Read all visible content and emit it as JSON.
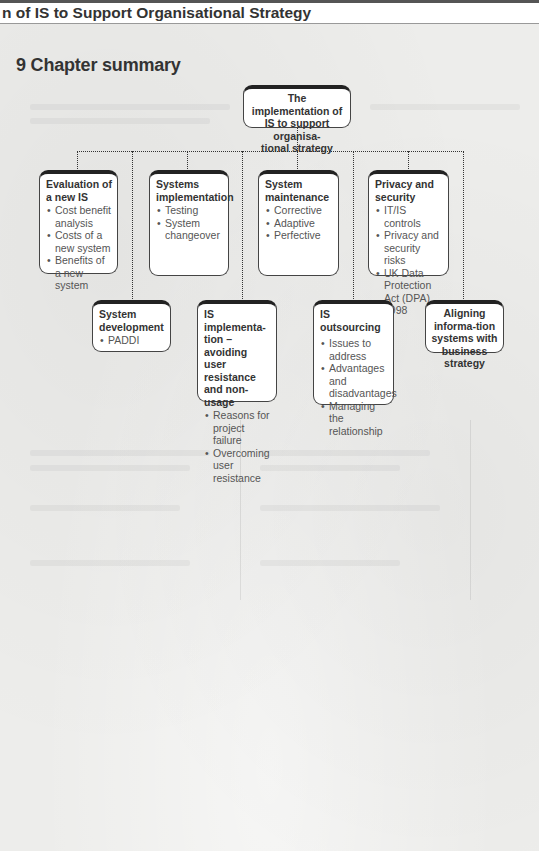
{
  "header": {
    "running_head": "n of IS to Support Organisational Strategy"
  },
  "chapter": {
    "title": "9 Chapter summary"
  },
  "diagram": {
    "root": {
      "title": "The implementation of IS to support organisa-tional strategy",
      "lines": [
        "The implementation of",
        "IS to support organisa-",
        "tional strategy"
      ]
    },
    "row1": [
      {
        "title": "Evaluation of a new IS",
        "items": [
          "Cost benefit analysis",
          "Costs of a new system",
          "Benefits of a new system"
        ]
      },
      {
        "title": "Systems implementation",
        "items": [
          "Testing",
          "System changeover"
        ]
      },
      {
        "title": "System maintenance",
        "items": [
          "Corrective",
          "Adaptive",
          "Perfective"
        ]
      },
      {
        "title": "Privacy and security",
        "items": [
          "IT/IS controls",
          "Privacy and security risks",
          "UK Data Protection Act (DPA) 1998"
        ]
      }
    ],
    "row2": [
      {
        "title": "System development",
        "items": [
          "PADDI"
        ]
      },
      {
        "title": "IS implementa-tion – avoiding user resistance and non-usage",
        "items": [
          "Reasons for project failure",
          "Overcoming user resistance"
        ]
      },
      {
        "title": "IS outsourcing",
        "items": [
          "Issues to address",
          "Advantages and disadvantages",
          "Managing the relationship"
        ]
      },
      {
        "title": "Aligning informa-tion systems with business strategy",
        "items": []
      }
    ]
  },
  "colors": {
    "box_border": "#222222",
    "box_fill": "#ffffff",
    "title_text": "#333333",
    "bullet_text": "#555555",
    "page_bg": "#ededeb"
  }
}
